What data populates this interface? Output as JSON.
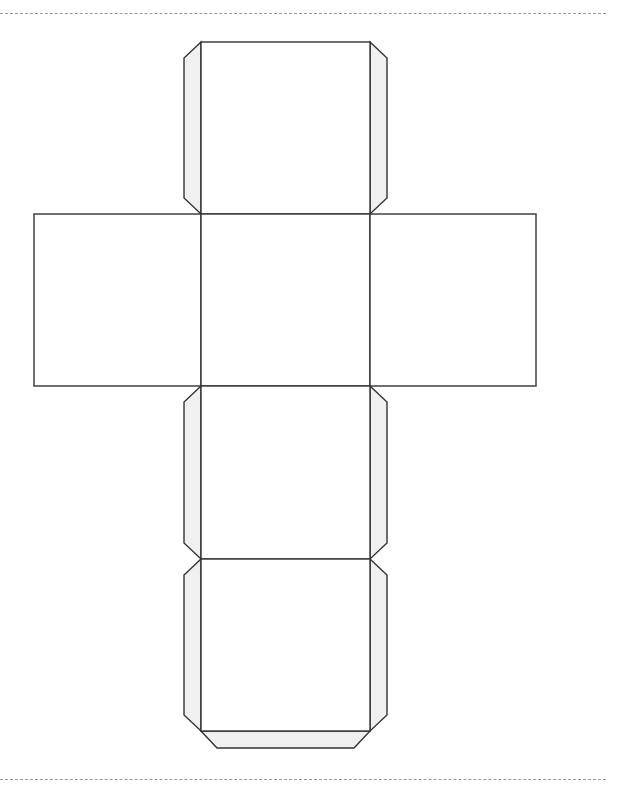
{
  "document": {
    "type": "cube-net-template",
    "stroke_color": "#333333",
    "tab_fill": "#f0f0f0",
    "face_fill": "#ffffff",
    "faces": [
      {
        "id": "top-face",
        "x": 201,
        "y": 42,
        "w": 169,
        "h": 172
      },
      {
        "id": "left-face",
        "x": 34,
        "y": 214,
        "w": 167,
        "h": 172
      },
      {
        "id": "center-face",
        "x": 201,
        "y": 214,
        "w": 169,
        "h": 172
      },
      {
        "id": "right-face",
        "x": 370,
        "y": 214,
        "w": 166,
        "h": 172
      },
      {
        "id": "lower-face",
        "x": 201,
        "y": 386,
        "w": 169,
        "h": 173
      },
      {
        "id": "bottom-face",
        "x": 201,
        "y": 559,
        "w": 169,
        "h": 172
      }
    ],
    "top_cut_line_y": 13,
    "bottom_cut_line_y": 779
  }
}
